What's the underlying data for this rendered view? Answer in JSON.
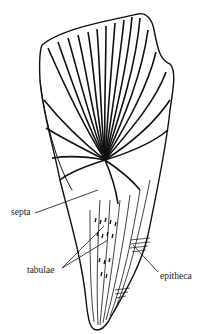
{
  "figure": {
    "labels": {
      "septa": "septa",
      "tabulae": "tabulae",
      "epitheca": "epitheca"
    }
  },
  "colors": {
    "ink": "#111111",
    "background": "#ffffff"
  }
}
